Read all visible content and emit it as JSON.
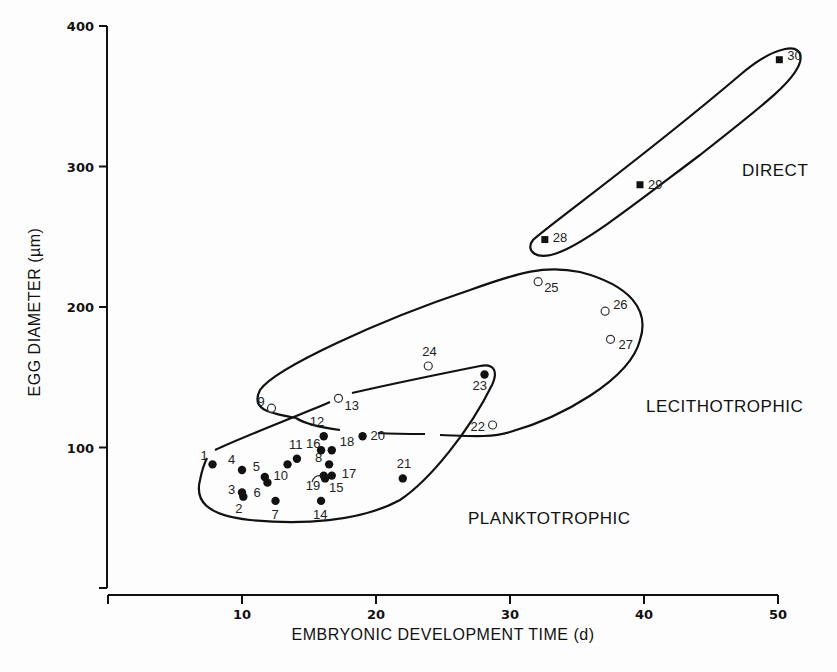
{
  "chart_data": {
    "type": "scatter",
    "title": "",
    "xlabel": "EMBRYONIC DEVELOPMENT TIME (d)",
    "ylabel": "EGG DIAMETER (µm)",
    "xlim": [
      0,
      50
    ],
    "ylim": [
      0,
      400
    ],
    "x_ticks": [
      10,
      20,
      30,
      40,
      50
    ],
    "y_ticks": [
      100,
      200,
      300,
      400
    ],
    "grid": false,
    "legend": null,
    "annotations": [
      {
        "text": "DIRECT",
        "group": "direct"
      },
      {
        "text": "LECITHOTROPHIC",
        "group": "lecithotrophic"
      },
      {
        "text": "PLANKTOTROPHIC",
        "group": "planktotrophic"
      }
    ],
    "series": [
      {
        "name": "Planktotrophic",
        "marker": "filled-circle",
        "points": [
          {
            "id": 1,
            "x": 7.8,
            "y": 88
          },
          {
            "id": 2,
            "x": 10.1,
            "y": 65
          },
          {
            "id": 3,
            "x": 10.0,
            "y": 68
          },
          {
            "id": 4,
            "x": 10.0,
            "y": 84
          },
          {
            "id": 5,
            "x": 11.7,
            "y": 79
          },
          {
            "id": 6,
            "x": 11.9,
            "y": 75
          },
          {
            "id": 7,
            "x": 12.5,
            "y": 62
          },
          {
            "id": 8,
            "x": 16.5,
            "y": 88
          },
          {
            "id": 10,
            "x": 13.4,
            "y": 88
          },
          {
            "id": 11,
            "x": 14.1,
            "y": 92
          },
          {
            "id": 12,
            "x": 16.1,
            "y": 108
          },
          {
            "id": 14,
            "x": 15.9,
            "y": 62
          },
          {
            "id": 15,
            "x": 16.2,
            "y": 78
          },
          {
            "id": 16,
            "x": 15.9,
            "y": 98
          },
          {
            "id": 17,
            "x": 16.7,
            "y": 80
          },
          {
            "id": 18,
            "x": 16.7,
            "y": 98
          },
          {
            "id": 19,
            "x": 16.1,
            "y": 80
          },
          {
            "id": 20,
            "x": 19.0,
            "y": 108
          },
          {
            "id": 21,
            "x": 22.0,
            "y": 78
          },
          {
            "id": 23,
            "x": 28.1,
            "y": 152
          }
        ]
      },
      {
        "name": "Lecithotrophic",
        "marker": "open-circle",
        "points": [
          {
            "id": 9,
            "x": 12.2,
            "y": 128
          },
          {
            "id": 13,
            "x": 17.2,
            "y": 135
          },
          {
            "id": 22,
            "x": 28.7,
            "y": 116
          },
          {
            "id": 24,
            "x": 23.9,
            "y": 158
          },
          {
            "id": 25,
            "x": 32.1,
            "y": 218
          },
          {
            "id": 26,
            "x": 37.1,
            "y": 197
          },
          {
            "id": 27,
            "x": 37.5,
            "y": 177
          }
        ]
      },
      {
        "name": "Direct",
        "marker": "filled-square",
        "points": [
          {
            "id": 28,
            "x": 32.6,
            "y": 248
          },
          {
            "id": 29,
            "x": 39.7,
            "y": 287
          },
          {
            "id": 30,
            "x": 50.1,
            "y": 376
          }
        ]
      }
    ]
  },
  "labels": {
    "xlabel": "EMBRYONIC DEVELOPMENT TIME (d)",
    "ylabel": "EGG DIAMETER (µm)",
    "direct": "DIRECT",
    "lecithotrophic": "LECITHOTROPHIC",
    "planktotrophic": "PLANKTOTROPHIC"
  },
  "colors": {
    "ink": "#111111",
    "background": "#fdfdfd"
  }
}
